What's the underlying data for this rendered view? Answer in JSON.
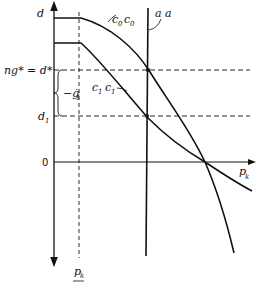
{
  "diagram": {
    "y_axis_label": "d",
    "x_axis_label": "p",
    "x_axis_label_sub": "k",
    "origin_label": "0",
    "d_star_label": "ng* = d*",
    "d1_label": "d",
    "d1_sub": "1",
    "g_label": "−ġ",
    "g_sub": "1",
    "pk_bottom_label": "p",
    "pk_bottom_sub": "k",
    "curve_c0_label": "c",
    "curve_c0_sub": "0",
    "curve_c1_label": "c",
    "curve_c1_sub": "1",
    "line_aa_label": "a a",
    "ink_color": "#111111"
  }
}
